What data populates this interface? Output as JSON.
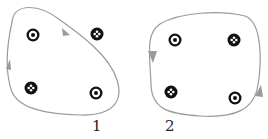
{
  "figures": [
    {
      "label": "1",
      "loop_direction": "clockwise",
      "symbols": [
        {
          "type": "dot",
          "x": 33,
          "y": 35
        },
        {
          "type": "cross",
          "x": 97,
          "y": 34
        },
        {
          "type": "cross",
          "x": 31,
          "y": 88
        },
        {
          "type": "dot",
          "x": 96,
          "y": 93
        }
      ]
    },
    {
      "label": "2",
      "loop_direction": "counterclockwise",
      "symbols": [
        {
          "type": "dot",
          "x": 175,
          "y": 40
        },
        {
          "type": "cross",
          "x": 234,
          "y": 40
        },
        {
          "type": "cross",
          "x": 171,
          "y": 92
        },
        {
          "type": "dot",
          "x": 235,
          "y": 98
        }
      ]
    }
  ],
  "colors": {
    "loop": "#9a9a9a",
    "symbol": "#111111"
  }
}
